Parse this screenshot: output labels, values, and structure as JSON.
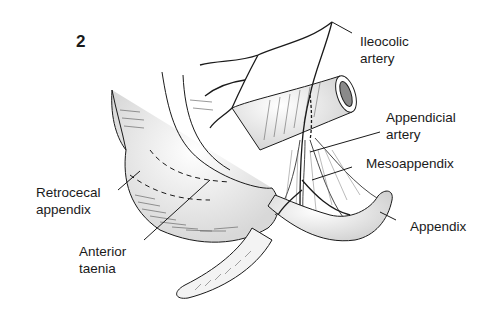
{
  "figure": {
    "number": "2"
  },
  "labels": [
    {
      "id": "ileocolic-artery",
      "lines": [
        "Ileocolic",
        "artery"
      ]
    },
    {
      "id": "appendicial-artery",
      "lines": [
        "Appendicial",
        "artery"
      ]
    },
    {
      "id": "mesoappendix",
      "lines": [
        "Mesoappendix"
      ]
    },
    {
      "id": "appendix",
      "lines": [
        "Appendix"
      ]
    },
    {
      "id": "retrocecal-appendix",
      "lines": [
        "Retrocecal",
        "appendix"
      ]
    },
    {
      "id": "anterior-taenia",
      "lines": [
        "Anterior",
        "taenia"
      ]
    }
  ],
  "colors": {
    "ink": "#1a1a1a",
    "shade": "#cfcfcf",
    "background": "#ffffff"
  }
}
